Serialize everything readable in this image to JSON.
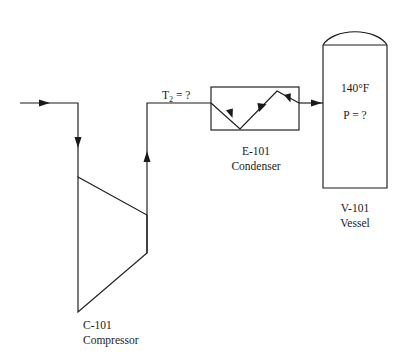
{
  "diagram": {
    "line_color": "#1a1a1a",
    "background_color": "#ffffff",
    "equipment": [
      {
        "id": "C-101",
        "tag": "C-101",
        "name": "Compressor",
        "symbol": "trapezoid"
      },
      {
        "id": "E-101",
        "tag": "E-101",
        "name": "Condenser",
        "symbol": "zigzag-box"
      },
      {
        "id": "V-101",
        "tag": "V-101",
        "name": "Vessel",
        "symbol": "domed-vertical-vessel"
      }
    ],
    "stream_labels": {
      "compressor_outlet_temp_prefix": "T",
      "compressor_outlet_temp_subscript": "2",
      "compressor_outlet_temp_value": " = ?"
    },
    "vessel_conditions": {
      "temperature": "140°F",
      "pressure": "P = ?"
    },
    "labels": {
      "compressor_tag": "C-101",
      "compressor_name": "Compressor",
      "condenser_tag": "E-101",
      "condenser_name": "Condenser",
      "vessel_tag": "V-101",
      "vessel_name": "Vessel"
    }
  }
}
